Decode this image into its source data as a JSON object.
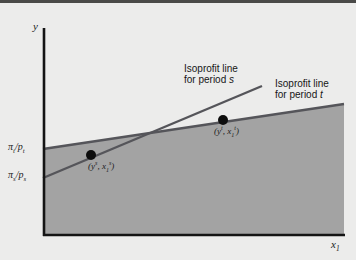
{
  "figure": {
    "kind": "economics-diagram",
    "background_color": "#ececeb",
    "shaded_region_color": "#a3a3a3",
    "line_color": "#55555a",
    "axis_color": "#141414",
    "point_color": "#0d0d0d"
  },
  "axes": {
    "y_label": "y",
    "x_label_base": "x",
    "x_label_sub": "1",
    "origin_px": [
      43,
      235
    ],
    "y_top_px": [
      43,
      28
    ],
    "x_right_px": [
      340,
      235
    ]
  },
  "ticks": [
    {
      "name": "pi-t-over-p-t",
      "numerator": "π",
      "numerator_sub": "t",
      "denominator": "p",
      "denominator_sub": "t",
      "y_px": 148
    },
    {
      "name": "pi-s-over-p-s",
      "numerator": "π",
      "numerator_sub": "s",
      "denominator": "p",
      "denominator_sub": "s",
      "y_px": 176
    }
  ],
  "lines": [
    {
      "name": "isoprofit-line-period-s",
      "period": "s",
      "x1": 43,
      "y1": 178,
      "x2": 262,
      "y2": 86,
      "intercept_tick": "pi-s-over-p-s"
    },
    {
      "name": "isoprofit-line-period-t",
      "period": "t",
      "x1": 43,
      "y1": 149,
      "x2": 344,
      "y2": 104,
      "intercept_tick": "pi-t-over-p-t"
    }
  ],
  "intersection_px": [
    157,
    135
  ],
  "points": [
    {
      "name": "point-period-s",
      "cx": 91,
      "cy": 155,
      "r": 5,
      "label_open": "(",
      "label_y": "y",
      "label_y_sup": "s",
      "label_sep": ", ",
      "label_x": "x",
      "label_x_sub": "1",
      "label_x_sup": "s",
      "label_close": ")",
      "label_left_px": 88,
      "label_top_px": 160
    },
    {
      "name": "point-period-t",
      "cx": 223,
      "cy": 120,
      "r": 5,
      "label_open": "(",
      "label_y": "y",
      "label_y_sup": "t",
      "label_sep": ", ",
      "label_x": "x",
      "label_x_sub": "1",
      "label_x_sup": "t",
      "label_close": ")",
      "label_left_px": 214,
      "label_top_px": 125
    }
  ],
  "callouts": [
    {
      "name": "callout-period-s",
      "line1": "Isoprofit line",
      "line2_prefix": "for period ",
      "line2_period": "s",
      "left_px": 184,
      "top_px": 63
    },
    {
      "name": "callout-period-t",
      "line1": "Isoprofit line",
      "line2_prefix": "for period ",
      "line2_period": "t",
      "left_px": 275,
      "top_px": 78
    }
  ]
}
